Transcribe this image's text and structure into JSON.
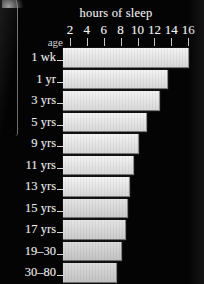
{
  "chart_data": {
    "type": "bar",
    "title": "hours of sleep",
    "xlabel": "hours of sleep",
    "ylabel": "age",
    "orientation": "horizontal",
    "grid": false,
    "legend": null,
    "xlim": [
      0,
      17
    ],
    "xticks": [
      2,
      4,
      6,
      8,
      10,
      12,
      14,
      16
    ],
    "xticklabels": [
      "2",
      "4",
      "6",
      "8",
      "10",
      "12",
      "14",
      "16"
    ],
    "categories": [
      "1 wk",
      "1 yr",
      "3 yrs",
      "5 yrs",
      "9 yrs",
      "11 yrs",
      "13 yrs",
      "15 yrs",
      "17 yrs",
      "19–30",
      "30–80"
    ],
    "values": [
      16.0,
      13.5,
      12.5,
      11.0,
      10.0,
      9.5,
      9.0,
      8.8,
      8.5,
      8.0,
      7.5
    ]
  },
  "axis": {
    "y_caption": "age"
  }
}
